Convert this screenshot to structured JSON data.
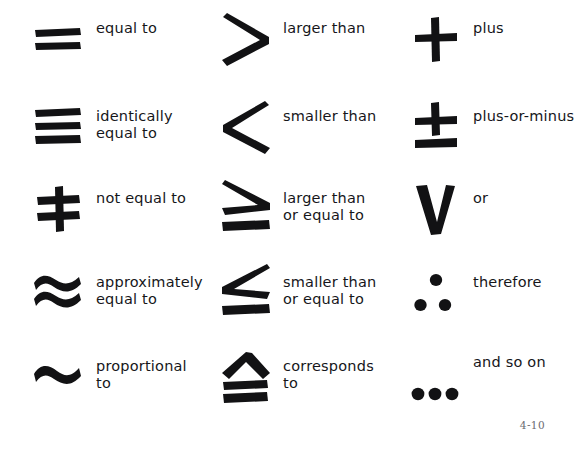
{
  "page": {
    "page_number": "4-10",
    "background_color": "#ffffff",
    "ink_color": "#121214"
  },
  "columns": [
    {
      "name": "column-1",
      "entries": [
        {
          "symbol_name": "equals-symbol",
          "symbol": "=",
          "label_line1": "equal to",
          "label_line2": ""
        },
        {
          "symbol_name": "identical-to-symbol",
          "symbol": "≡",
          "label_line1": "identically",
          "label_line2": "equal to"
        },
        {
          "symbol_name": "not-equal-symbol",
          "symbol": "≠",
          "label_line1": "not equal to",
          "label_line2": ""
        },
        {
          "symbol_name": "approximately-equal-symbol",
          "symbol": "≈",
          "label_line1": "approximately",
          "label_line2": "equal to"
        },
        {
          "symbol_name": "proportional-to-symbol",
          "symbol": "∼",
          "label_line1": "proportional",
          "label_line2": "to"
        }
      ]
    },
    {
      "name": "column-2",
      "entries": [
        {
          "symbol_name": "greater-than-symbol",
          "symbol": ">",
          "label_line1": "larger than",
          "label_line2": ""
        },
        {
          "symbol_name": "less-than-symbol",
          "symbol": "<",
          "label_line1": "smaller than",
          "label_line2": ""
        },
        {
          "symbol_name": "greater-than-or-equal-symbol",
          "symbol": "≥",
          "label_line1": "larger than",
          "label_line2": "or equal to"
        },
        {
          "symbol_name": "less-than-or-equal-symbol",
          "symbol": "≤",
          "label_line1": "smaller than",
          "label_line2": "or equal to"
        },
        {
          "symbol_name": "corresponds-to-symbol",
          "symbol": "≙",
          "label_line1": "corresponds",
          "label_line2": "to"
        }
      ]
    },
    {
      "name": "column-3",
      "entries": [
        {
          "symbol_name": "plus-symbol",
          "symbol": "+",
          "label_line1": "plus",
          "label_line2": ""
        },
        {
          "symbol_name": "plus-or-minus-symbol",
          "symbol": "±",
          "label_line1": "plus-or-minus",
          "label_line2": ""
        },
        {
          "symbol_name": "logical-or-symbol",
          "symbol": "V",
          "label_line1": "or",
          "label_line2": ""
        },
        {
          "symbol_name": "therefore-symbol",
          "symbol": "∴",
          "label_line1": "therefore",
          "label_line2": ""
        },
        {
          "symbol_name": "ellipsis-symbol",
          "symbol": "…",
          "label_line1": "and so on",
          "label_line2": ""
        }
      ]
    }
  ]
}
